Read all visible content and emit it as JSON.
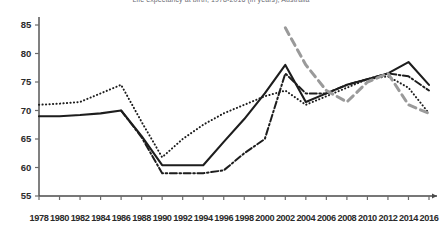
{
  "chart_data": {
    "type": "line",
    "title": "Life expectancy at birth, 1978-2016 (in years), Australia",
    "xlabel": "",
    "ylabel": "",
    "ylim": [
      55,
      85
    ],
    "xlim": [
      1978,
      2016
    ],
    "ytick_step": 5,
    "xtick_step": 2,
    "grid": false,
    "legend_position": "none",
    "yticks": [
      "85",
      "80",
      "75",
      "70",
      "65",
      "60",
      "55"
    ],
    "categories": [
      1978,
      1980,
      1982,
      1984,
      1986,
      1988,
      1990,
      1992,
      1994,
      1996,
      1998,
      2000,
      2002,
      2004,
      2006,
      2008,
      2010,
      2012,
      2014,
      2016
    ],
    "series": [
      {
        "name": "Series 1 (solid black)",
        "style": "solid",
        "color": "#1d1d1d",
        "width": 2.1,
        "values": [
          69,
          69,
          69.2,
          69.5,
          70,
          65.5,
          60.4,
          60.4,
          60.4,
          64.5,
          68.5,
          73,
          78,
          71.5,
          73,
          74.5,
          75.5,
          76.5,
          78.5,
          74.5
        ]
      },
      {
        "name": "Series 2 (dotted black)",
        "style": "dotted",
        "color": "#1d1d1d",
        "width": 2.0,
        "values": [
          71,
          71.2,
          71.5,
          73,
          74.5,
          68,
          61.8,
          65,
          67.5,
          69.5,
          71,
          72.5,
          73.5,
          71,
          72.5,
          74,
          75.5,
          76,
          74,
          69.5
        ]
      },
      {
        "name": "Series 3 (dash-dot black)",
        "style": "dashdot",
        "color": "#1d1d1d",
        "width": 2.0,
        "values": [
          null,
          null,
          null,
          null,
          70,
          65.3,
          59,
          59,
          59,
          59.5,
          62.5,
          65,
          76.5,
          73,
          73,
          74.5,
          75.5,
          76.5,
          76,
          73.5
        ]
      },
      {
        "name": "Series 4 (dashed grey)",
        "style": "dashed",
        "color": "#9a9a9a",
        "width": 3.0,
        "values": [
          null,
          null,
          null,
          null,
          null,
          null,
          null,
          null,
          null,
          null,
          null,
          null,
          84.5,
          78,
          73.5,
          71.5,
          75,
          76.5,
          71,
          69.5
        ]
      }
    ]
  },
  "axis": {
    "axis_color": "#4a4a4a",
    "tick_color": "#6a6a6a"
  }
}
